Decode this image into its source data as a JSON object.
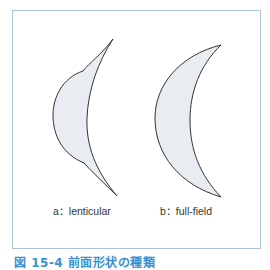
{
  "figure": {
    "lenses": [
      {
        "id": "a",
        "label": "a：lenticular"
      },
      {
        "id": "b",
        "label": "b：full-field"
      }
    ],
    "caption": "図 15-4 前面形状の種類",
    "colors": {
      "frame_border": "#a9c4da",
      "lens_fill": "#e9edf1",
      "lens_stroke": "#333333",
      "caption": "#3a8fd0"
    }
  }
}
